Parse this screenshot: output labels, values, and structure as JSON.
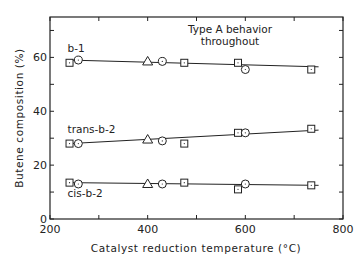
{
  "chart_data": {
    "type": "line",
    "title": "",
    "annotation": [
      "Type A behavior",
      "throughout"
    ],
    "xlabel": "Catalyst reduction temperature (°C)",
    "ylabel": "Butene composition (%)",
    "xlim": [
      200,
      800
    ],
    "ylim": [
      0,
      75
    ],
    "x_ticks": [
      200,
      400,
      600,
      800
    ],
    "x_minor_ticks": [
      300,
      500,
      700
    ],
    "y_ticks": [
      0,
      20,
      40,
      60
    ],
    "y_minor_ticks": [
      10,
      30,
      50,
      70
    ],
    "grid": false,
    "legend": "none (series labeled inline)",
    "marker_legend": {
      "square": "catalyst sample (square)",
      "circle": "catalyst sample (circle)",
      "triangle": "catalyst sample (triangle)"
    },
    "series": [
      {
        "name": "b-1",
        "label_pos": [
          240,
          62
        ],
        "fit_line": [
          [
            240,
            59
          ],
          [
            750,
            56.5
          ]
        ],
        "points": [
          {
            "x": 240,
            "y": 58,
            "marker": "square"
          },
          {
            "x": 258,
            "y": 59,
            "marker": "circle"
          },
          {
            "x": 400,
            "y": 58.5,
            "marker": "triangle"
          },
          {
            "x": 430,
            "y": 58.5,
            "marker": "circle"
          },
          {
            "x": 475,
            "y": 58,
            "marker": "square"
          },
          {
            "x": 585,
            "y": 58,
            "marker": "square"
          },
          {
            "x": 600,
            "y": 55.5,
            "marker": "circle"
          },
          {
            "x": 735,
            "y": 55.5,
            "marker": "square"
          }
        ]
      },
      {
        "name": "trans-b-2",
        "label_pos": [
          240,
          32
        ],
        "fit_line": [
          [
            240,
            28
          ],
          [
            750,
            33
          ]
        ],
        "points": [
          {
            "x": 240,
            "y": 28,
            "marker": "square"
          },
          {
            "x": 258,
            "y": 28,
            "marker": "circle"
          },
          {
            "x": 400,
            "y": 29.5,
            "marker": "triangle"
          },
          {
            "x": 430,
            "y": 29,
            "marker": "circle"
          },
          {
            "x": 475,
            "y": 28,
            "marker": "square"
          },
          {
            "x": 585,
            "y": 32,
            "marker": "square"
          },
          {
            "x": 600,
            "y": 32,
            "marker": "circle"
          },
          {
            "x": 735,
            "y": 33.5,
            "marker": "square"
          }
        ]
      },
      {
        "name": "cis-b-2",
        "label_pos": [
          240,
          8
        ],
        "fit_line": [
          [
            240,
            13.5
          ],
          [
            750,
            12.5
          ]
        ],
        "points": [
          {
            "x": 240,
            "y": 13.5,
            "marker": "square"
          },
          {
            "x": 258,
            "y": 13,
            "marker": "circle"
          },
          {
            "x": 400,
            "y": 13,
            "marker": "triangle"
          },
          {
            "x": 430,
            "y": 13,
            "marker": "circle"
          },
          {
            "x": 475,
            "y": 13.5,
            "marker": "square"
          },
          {
            "x": 585,
            "y": 11,
            "marker": "square"
          },
          {
            "x": 600,
            "y": 13,
            "marker": "circle"
          },
          {
            "x": 735,
            "y": 12.5,
            "marker": "square"
          }
        ]
      }
    ]
  },
  "layout": {
    "plot_left": 50,
    "plot_right": 343,
    "plot_top": 17,
    "plot_bottom": 219,
    "ink_color": "#222222"
  }
}
